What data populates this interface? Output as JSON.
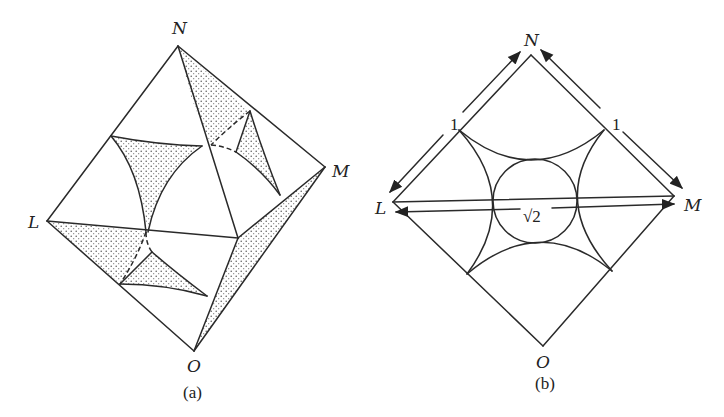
{
  "figure_a": {
    "caption": "(a)",
    "vertices": {
      "N": {
        "label": "N",
        "x": 178,
        "y": 46
      },
      "M": {
        "label": "M",
        "x": 325,
        "y": 167
      },
      "L": {
        "label": "L",
        "x": 47,
        "y": 221
      },
      "O": {
        "label": "O",
        "x": 194,
        "y": 351
      },
      "P": {
        "label": "",
        "x": 238,
        "y": 238
      }
    },
    "description": "Octahedral/tetrahedral cell with shaded curvilinear triangular regions"
  },
  "figure_b": {
    "caption": "(b)",
    "vertices": {
      "N": {
        "label": "N",
        "x": 531,
        "y": 55
      },
      "M": {
        "label": "M",
        "x": 674,
        "y": 196
      },
      "L": {
        "label": "L",
        "x": 393,
        "y": 202
      },
      "O": {
        "label": "O",
        "x": 543,
        "y": 346
      }
    },
    "dimensions": {
      "LN": "1",
      "NM": "1",
      "LM": "√2"
    },
    "inscribed_circle": {
      "cx": 535,
      "cy": 201,
      "r": 42
    }
  },
  "colors": {
    "stroke": "#2a2a2a",
    "background": "#ffffff",
    "shading": "#555555"
  }
}
